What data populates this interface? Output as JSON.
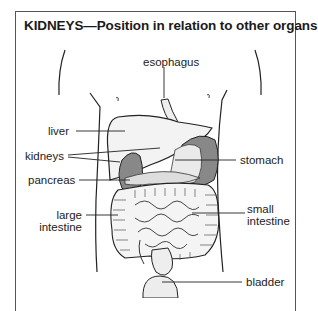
{
  "title": "KIDNEYS—Position in relation to other organs",
  "labels": {
    "esophagus": "esophagus",
    "liver": "liver",
    "kidneys": "kidneys",
    "pancreas": "pancreas",
    "stomach": "stomach",
    "large_intestine_1": "large",
    "large_intestine_2": "intestine",
    "small_intestine_1": "small",
    "small_intestine_2": "intestine",
    "bladder": "bladder"
  },
  "colors": {
    "line": "#222222",
    "organ_fill": "#f2f2f2",
    "kidney_fill": "#8a8a8a",
    "frame": "#555555"
  }
}
